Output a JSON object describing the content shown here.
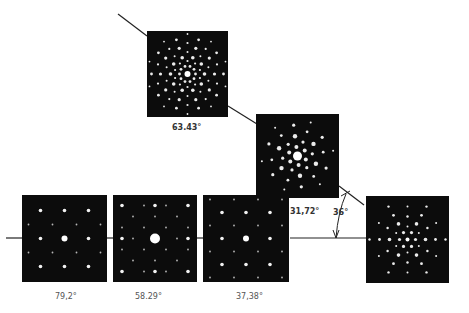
{
  "figure": {
    "panels": [
      {
        "id": "top",
        "angle_label": "63.43°",
        "symmetry": "5-fold"
      },
      {
        "id": "middle",
        "angle_label": "31,72°",
        "symmetry": "quasi-2-fold"
      },
      {
        "id": "bottom-1",
        "angle_label": "79,2°",
        "symmetry": "2-fold"
      },
      {
        "id": "bottom-2",
        "angle_label": "58.29°",
        "symmetry": "2-fold"
      },
      {
        "id": "bottom-3",
        "angle_label": "37,38°",
        "symmetry": "2-fold"
      },
      {
        "id": "right",
        "angle_label": "",
        "symmetry": "3-fold"
      }
    ],
    "rotation_annotation": "36°"
  }
}
